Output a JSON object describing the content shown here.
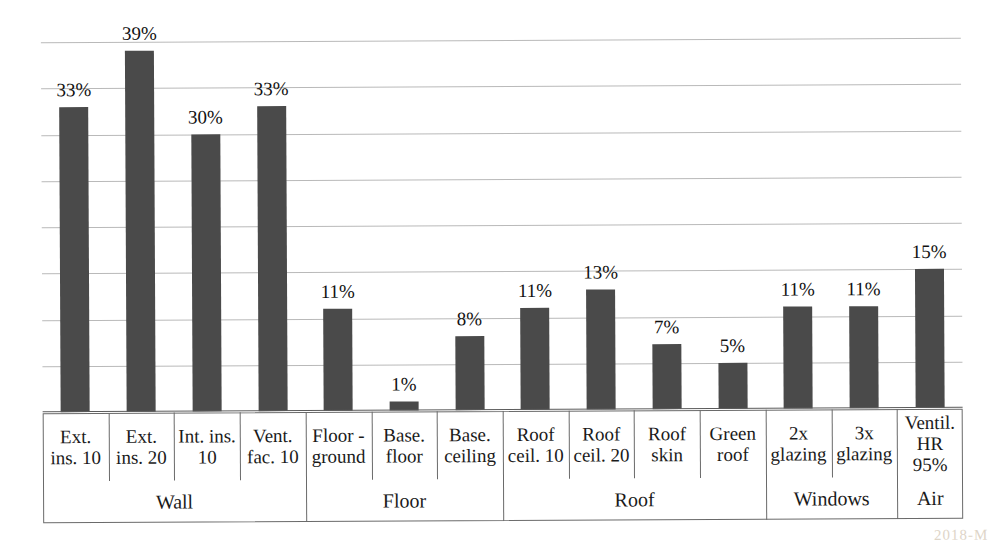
{
  "chart_data": {
    "type": "bar",
    "title": "",
    "xlabel": "",
    "ylabel": "",
    "ylim": [
      0,
      40
    ],
    "grid": true,
    "gridline_values": [
      0,
      5,
      10,
      15,
      20,
      25,
      30,
      35,
      40
    ],
    "legend": "none",
    "categories": [
      "Ext. ins. 10",
      "Ext. ins. 20",
      "Int. ins. 10",
      "Vent. fac. 10",
      "Floor - ground",
      "Base. floor",
      "Base. ceiling",
      "Roof ceil. 10",
      "Roof ceil. 20",
      "Roof skin",
      "Green roof",
      "2x glazing",
      "3x glazing",
      "Ventil. HR 95%"
    ],
    "values": [
      33,
      39,
      30,
      33,
      11,
      1,
      8,
      11,
      13,
      7,
      5,
      11,
      11,
      15
    ],
    "data_labels": [
      "33%",
      "39%",
      "30%",
      "33%",
      "11%",
      "1%",
      "8%",
      "11%",
      "13%",
      "7%",
      "5%",
      "11%",
      "11%",
      "15%"
    ],
    "bar_color": "#4a4a4a"
  },
  "axis_table": {
    "category_cells": [
      {
        "line1": "Ext.",
        "line2": "ins. 10",
        "line3": ""
      },
      {
        "line1": "Ext.",
        "line2": "ins. 20",
        "line3": ""
      },
      {
        "line1": "Int. ins.",
        "line2": "10",
        "line3": ""
      },
      {
        "line1": "Vent.",
        "line2": "fac. 10",
        "line3": ""
      },
      {
        "line1": "Floor -",
        "line2": "ground",
        "line3": ""
      },
      {
        "line1": "Base.",
        "line2": "floor",
        "line3": ""
      },
      {
        "line1": "Base.",
        "line2": "ceiling",
        "line3": ""
      },
      {
        "line1": "Roof",
        "line2": "ceil. 10",
        "line3": ""
      },
      {
        "line1": "Roof",
        "line2": "ceil. 20",
        "line3": ""
      },
      {
        "line1": "Roof",
        "line2": "skin",
        "line3": ""
      },
      {
        "line1": "Green",
        "line2": "roof",
        "line3": ""
      },
      {
        "line1": "2x",
        "line2": "glazing",
        "line3": ""
      },
      {
        "line1": "3x",
        "line2": "glazing",
        "line3": ""
      },
      {
        "line1": "Ventil.",
        "line2": "HR",
        "line3": "95%"
      }
    ],
    "groups": [
      {
        "label": "Wall",
        "start": 0,
        "span": 4
      },
      {
        "label": "Floor",
        "start": 4,
        "span": 3
      },
      {
        "label": "Roof",
        "start": 7,
        "span": 4
      },
      {
        "label": "Windows",
        "start": 11,
        "span": 2
      },
      {
        "label": "Air",
        "start": 13,
        "span": 1
      }
    ]
  },
  "watermark": {
    "text": "2018-M"
  }
}
